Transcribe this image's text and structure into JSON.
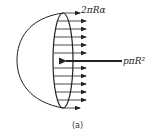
{
  "labels": {
    "surface_tension_force": "2πRα",
    "pressure_force": "pπR²",
    "caption": "(a)"
  },
  "colors": {
    "ink": "#222222",
    "background": "#ffffff"
  }
}
